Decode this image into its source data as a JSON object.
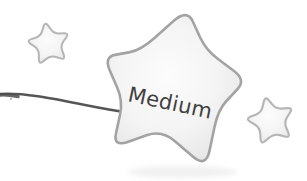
{
  "illustration": {
    "label": "Medium",
    "icons": {
      "large_star": "large-star-icon",
      "small_star_top_left": "small-star-icon",
      "small_star_right": "small-star-icon",
      "wand_line": "wand-line-icon"
    },
    "colors": {
      "background": "#ffffff",
      "star_fill_center": "#fbfbfb",
      "star_fill_edge": "#e4e4e4",
      "large_star_outline": "#a3a3a3",
      "small_star_outline": "#b6b6b6",
      "wand_line": "#565656",
      "wand_line_start": "#4c4c4c",
      "label_text": "#3f3f3f"
    }
  }
}
